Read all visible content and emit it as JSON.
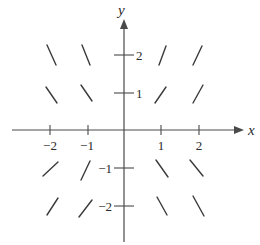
{
  "figure": {
    "type": "slope-field",
    "x_axis": {
      "label": "x",
      "ticks": [
        {
          "value": -2,
          "label": "−2"
        },
        {
          "value": -1,
          "label": "−1"
        },
        {
          "value": 1,
          "label": "1"
        },
        {
          "value": 2,
          "label": "2"
        }
      ]
    },
    "y_axis": {
      "label": "y",
      "ticks": [
        {
          "value": 2,
          "label": "2"
        },
        {
          "value": 1,
          "label": "1"
        },
        {
          "value": -1,
          "label": "−1"
        },
        {
          "value": -2,
          "label": "−2"
        }
      ]
    },
    "segments": [
      {
        "x": -2,
        "y": 2,
        "direction": "negative",
        "steepness": "steep"
      },
      {
        "x": -1,
        "y": 2,
        "direction": "negative",
        "steepness": "steep"
      },
      {
        "x": 1,
        "y": 2,
        "direction": "positive",
        "steepness": "steep"
      },
      {
        "x": 2,
        "y": 2,
        "direction": "positive",
        "steepness": "steep"
      },
      {
        "x": -2,
        "y": 1,
        "direction": "negative",
        "steepness": "moderate"
      },
      {
        "x": -1,
        "y": 1,
        "direction": "negative",
        "steepness": "moderate"
      },
      {
        "x": 1,
        "y": 1,
        "direction": "positive",
        "steepness": "moderate"
      },
      {
        "x": 2,
        "y": 1,
        "direction": "positive",
        "steepness": "moderate"
      },
      {
        "x": -2,
        "y": -1,
        "direction": "positive",
        "steepness": "moderate"
      },
      {
        "x": -1,
        "y": -1,
        "direction": "positive",
        "steepness": "steep"
      },
      {
        "x": 1,
        "y": -1,
        "direction": "negative",
        "steepness": "moderate"
      },
      {
        "x": 2,
        "y": -1,
        "direction": "negative",
        "steepness": "moderate"
      },
      {
        "x": -2,
        "y": -2,
        "direction": "positive",
        "steepness": "moderate"
      },
      {
        "x": -1,
        "y": -2,
        "direction": "positive",
        "steepness": "moderate"
      },
      {
        "x": 1,
        "y": -2,
        "direction": "negative",
        "steepness": "steep"
      },
      {
        "x": 2,
        "y": -2,
        "direction": "negative",
        "steepness": "steep"
      }
    ]
  }
}
